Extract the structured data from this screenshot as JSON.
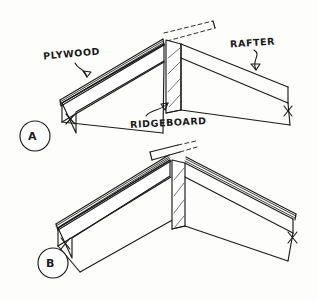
{
  "figure": {
    "type": "architectural-detail-drawing",
    "style": "hand-drawn-line-illustration",
    "background_color": "#fdfdfc",
    "line_color": "#1b1b1b",
    "width": 318,
    "height": 300
  },
  "labels": {
    "plywood": "PLYWOOD",
    "rafter": "RAFTER",
    "ridgeboard": "RIDGEBOARD"
  },
  "details": [
    {
      "tag": "A",
      "description": "Ridge detail with plywood sheathing overrunning the ridge board, phantom dashed line shows sheathing extension past the peak",
      "components": [
        "PLYWOOD",
        "RAFTER",
        "RIDGEBOARD"
      ]
    },
    {
      "tag": "B",
      "description": "Symmetric gable ridge detail with plywood sheathing on both slopes meeting at the ridge board",
      "components": [
        "PLYWOOD",
        "RAFTER",
        "RIDGEBOARD"
      ]
    }
  ],
  "annotations": {
    "break_marks": "Slash tick marks on rafter ends indicate break / continuation of member",
    "dashed_line": "Phantom line at detail A peak indicating sheathing extension",
    "hatching": "Diagonal hatch on ridge board face indicating cut wood section"
  }
}
